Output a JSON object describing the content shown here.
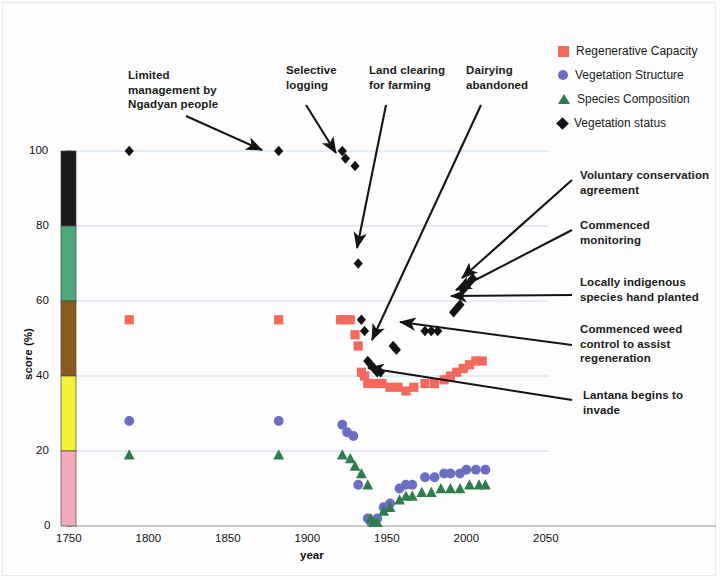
{
  "axes": {
    "xlabel": "year",
    "ylabel": "score (%)",
    "xticks": [
      "1750",
      "1800",
      "1850",
      "1900",
      "1950",
      "2000",
      "2050"
    ],
    "yticks": [
      "0",
      "20",
      "40",
      "60",
      "80",
      "100"
    ],
    "xlim": [
      1750,
      2050
    ],
    "ylim": [
      0,
      100
    ]
  },
  "legend": {
    "items": [
      {
        "label": "Regenerative Capacity",
        "marker": "square",
        "color": "#f4695c"
      },
      {
        "label": "Vegetation Structure",
        "marker": "circle",
        "color": "#6b6fc4"
      },
      {
        "label": "Species Composition",
        "marker": "triangle",
        "color": "#2f7d4f"
      },
      {
        "label": "Vegetation status",
        "marker": "diamond",
        "color": "#141414"
      }
    ]
  },
  "colorbar": {
    "segments": [
      {
        "range": [
          80,
          100
        ],
        "color": "#1a1a18"
      },
      {
        "range": [
          60,
          80
        ],
        "color": "#4ea87a"
      },
      {
        "range": [
          40,
          60
        ],
        "color": "#8a5a1f"
      },
      {
        "range": [
          20,
          40
        ],
        "color": "#f2f23b"
      },
      {
        "range": [
          0,
          20
        ],
        "color": "#f4a9bb"
      }
    ]
  },
  "annotations": [
    {
      "id": "limited-management",
      "text": "Limited\nmanagement by\nNgadyan people",
      "x": 128,
      "y": 68,
      "align": "left"
    },
    {
      "id": "selective-logging",
      "text": "Selective\nlogging",
      "x": 286,
      "y": 63,
      "align": "left"
    },
    {
      "id": "land-clearing",
      "text": "Land clearing\nfor farming",
      "x": 369,
      "y": 63,
      "align": "left"
    },
    {
      "id": "dairying-abandoned",
      "text": "Dairying\nabandoned",
      "x": 466,
      "y": 63,
      "align": "left"
    },
    {
      "id": "voluntary-conservation",
      "text": "Voluntary conservation\nagreement",
      "x": 580,
      "y": 168,
      "align": "left"
    },
    {
      "id": "commenced-monitoring",
      "text": "Commenced\nmonitoring",
      "x": 580,
      "y": 218,
      "align": "left"
    },
    {
      "id": "locally-indigenous",
      "text": "Locally indigenous\nspecies hand planted",
      "x": 580,
      "y": 275,
      "align": "left"
    },
    {
      "id": "commenced-weed-control",
      "text": "Commenced weed\ncontrol to assist\nregeneration",
      "x": 580,
      "y": 322,
      "align": "left"
    },
    {
      "id": "lantana-invade",
      "text": "Lantana begins to\ninvade",
      "x": 583,
      "y": 388,
      "align": "left"
    }
  ],
  "arrows": [
    {
      "id": "arrow-limited-management",
      "x1": 186,
      "y1": 116,
      "x2": 262,
      "y2": 150
    },
    {
      "id": "arrow-selective-logging",
      "x1": 306,
      "y1": 105,
      "x2": 336,
      "y2": 153
    },
    {
      "id": "arrow-land-clearing",
      "x1": 386,
      "y1": 105,
      "x2": 357,
      "y2": 248
    },
    {
      "id": "arrow-dairying-abandoned",
      "x1": 481,
      "y1": 105,
      "x2": 372,
      "y2": 340
    },
    {
      "id": "arrow-voluntary-conservation",
      "x1": 572,
      "y1": 180,
      "x2": 462,
      "y2": 278
    },
    {
      "id": "arrow-commenced-monitoring",
      "x1": 572,
      "y1": 230,
      "x2": 456,
      "y2": 290
    },
    {
      "id": "arrow-locally-indigenous",
      "x1": 572,
      "y1": 295,
      "x2": 451,
      "y2": 296
    },
    {
      "id": "arrow-commenced-weed",
      "x1": 572,
      "y1": 345,
      "x2": 400,
      "y2": 322
    },
    {
      "id": "arrow-lantana",
      "x1": 572,
      "y1": 400,
      "x2": 368,
      "y2": 368
    }
  ],
  "chart_data": {
    "type": "scatter",
    "title": "",
    "xlabel": "year",
    "ylabel": "score (%)",
    "xlim": [
      1750,
      2050
    ],
    "ylim": [
      0,
      100
    ],
    "grid": "horizontal",
    "legend_position": "top-right",
    "series": [
      {
        "name": "Regenerative Capacity",
        "marker": "square",
        "color": "#f4695c",
        "points": [
          [
            1786,
            55
          ],
          [
            1880,
            55
          ],
          [
            1919,
            55
          ],
          [
            1922,
            55
          ],
          [
            1925,
            55
          ],
          [
            1928,
            51
          ],
          [
            1930,
            48
          ],
          [
            1932,
            41
          ],
          [
            1934,
            40
          ],
          [
            1936,
            38
          ],
          [
            1940,
            38
          ],
          [
            1945,
            38
          ],
          [
            1950,
            37
          ],
          [
            1955,
            37
          ],
          [
            1960,
            36
          ],
          [
            1965,
            37
          ],
          [
            1972,
            38
          ],
          [
            1978,
            38
          ],
          [
            1984,
            39
          ],
          [
            1988,
            40
          ],
          [
            1992,
            41
          ],
          [
            1996,
            42
          ],
          [
            2000,
            43
          ],
          [
            2004,
            44
          ],
          [
            2008,
            44
          ]
        ]
      },
      {
        "name": "Vegetation Structure",
        "marker": "circle",
        "color": "#6b6fc4",
        "points": [
          [
            1786,
            28
          ],
          [
            1880,
            28
          ],
          [
            1920,
            27
          ],
          [
            1923,
            25
          ],
          [
            1927,
            24
          ],
          [
            1930,
            11
          ],
          [
            1936,
            2
          ],
          [
            1938,
            1
          ],
          [
            1940,
            1
          ],
          [
            1942,
            2
          ],
          [
            1946,
            5
          ],
          [
            1950,
            6
          ],
          [
            1956,
            10
          ],
          [
            1960,
            11
          ],
          [
            1964,
            11
          ],
          [
            1972,
            13
          ],
          [
            1978,
            13
          ],
          [
            1984,
            14
          ],
          [
            1988,
            14
          ],
          [
            1994,
            14
          ],
          [
            1998,
            15
          ],
          [
            2004,
            15
          ],
          [
            2010,
            15
          ]
        ]
      },
      {
        "name": "Species Composition",
        "marker": "triangle",
        "color": "#2f7d4f",
        "points": [
          [
            1786,
            19
          ],
          [
            1880,
            19
          ],
          [
            1920,
            19
          ],
          [
            1925,
            18
          ],
          [
            1928,
            16
          ],
          [
            1932,
            14
          ],
          [
            1936,
            11
          ],
          [
            1938,
            2
          ],
          [
            1940,
            1
          ],
          [
            1942,
            1
          ],
          [
            1946,
            4
          ],
          [
            1950,
            5
          ],
          [
            1956,
            7
          ],
          [
            1960,
            8
          ],
          [
            1964,
            8
          ],
          [
            1970,
            9
          ],
          [
            1976,
            9
          ],
          [
            1982,
            10
          ],
          [
            1988,
            10
          ],
          [
            1994,
            10
          ],
          [
            2000,
            11
          ],
          [
            2006,
            11
          ],
          [
            2010,
            11
          ]
        ]
      },
      {
        "name": "Vegetation status",
        "marker": "diamond",
        "color": "#141414",
        "points": [
          [
            1786,
            100
          ],
          [
            1880,
            100
          ],
          [
            1920,
            100
          ],
          [
            1922,
            98
          ],
          [
            1928,
            96
          ],
          [
            1930,
            70
          ],
          [
            1932,
            55
          ],
          [
            1934,
            52
          ],
          [
            1936,
            44
          ],
          [
            1938,
            43
          ],
          [
            1940,
            42
          ],
          [
            1942,
            41
          ],
          [
            1944,
            41
          ],
          [
            1952,
            48
          ],
          [
            1954,
            47
          ],
          [
            1972,
            52
          ],
          [
            1976,
            52
          ],
          [
            1980,
            52
          ],
          [
            1990,
            57
          ],
          [
            1992,
            58
          ],
          [
            1994,
            59
          ],
          [
            1996,
            63
          ],
          [
            1998,
            64
          ],
          [
            2000,
            65
          ],
          [
            2002,
            66
          ]
        ]
      }
    ]
  }
}
